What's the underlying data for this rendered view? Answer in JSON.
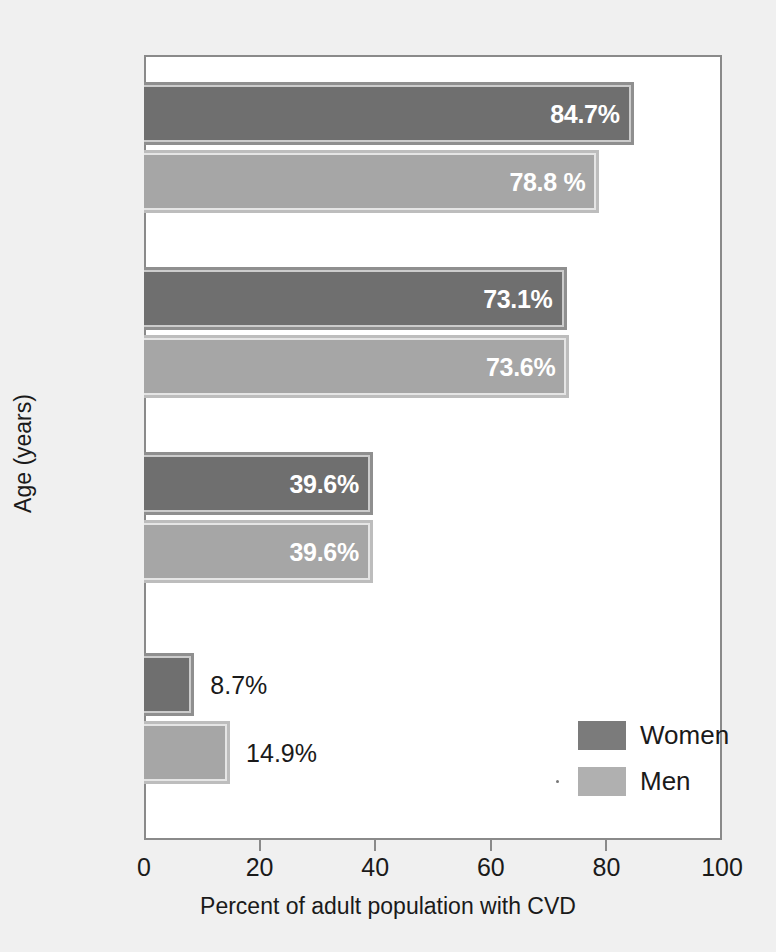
{
  "chart_data": {
    "type": "bar",
    "orientation": "horizontal",
    "title": "",
    "xlabel": "Percent of adult population with CVD",
    "ylabel": "Age (years)",
    "xlim": [
      0,
      100
    ],
    "xticks": [
      "0",
      "20",
      "40",
      "60",
      "80",
      "100"
    ],
    "grid": false,
    "legend_position": "bottom-right",
    "categories": [
      "80+",
      "60–79",
      "40–59",
      "20–30"
    ],
    "series": [
      {
        "name": "Women",
        "color": "#6f6f6f",
        "values": [
          84.7,
          73.1,
          39.6,
          8.7
        ],
        "labels": [
          "84.7%",
          "73.1%",
          "39.6%",
          "8.7%"
        ],
        "label_placement": [
          "inside",
          "inside",
          "inside",
          "outside"
        ]
      },
      {
        "name": "Men",
        "color": "#a6a6a6",
        "values": [
          78.8,
          73.6,
          39.6,
          14.9
        ],
        "labels": [
          "78.8 %",
          "73.6%",
          "39.6%",
          "14.9%"
        ],
        "label_placement": [
          "inside",
          "inside",
          "inside",
          "outside"
        ]
      }
    ]
  },
  "axes": {
    "x_title": "Percent of adult population with CVD",
    "y_title": "Age (years)",
    "x_ticks": [
      {
        "label": "0",
        "value": 0
      },
      {
        "label": "20",
        "value": 20
      },
      {
        "label": "40",
        "value": 40
      },
      {
        "label": "60",
        "value": 60
      },
      {
        "label": "80",
        "value": 80
      },
      {
        "label": "100",
        "value": 100
      }
    ],
    "y_ticks": [
      {
        "label": "80+"
      },
      {
        "label": "60–79"
      },
      {
        "label": "40–59"
      },
      {
        "label": "20–30"
      }
    ]
  },
  "legend": {
    "items": [
      {
        "label": "Women",
        "color": "#7b7b7b"
      },
      {
        "label": "Men",
        "color": "#b0b0b0"
      }
    ]
  },
  "bars": [
    {
      "group": "80+",
      "series": "Women",
      "value": 84.7,
      "label": "84.7%",
      "placement": "inside"
    },
    {
      "group": "80+",
      "series": "Men",
      "value": 78.8,
      "label": "78.8 %",
      "placement": "inside"
    },
    {
      "group": "60–79",
      "series": "Women",
      "value": 73.1,
      "label": "73.1%",
      "placement": "inside"
    },
    {
      "group": "60–79",
      "series": "Men",
      "value": 73.6,
      "label": "73.6%",
      "placement": "inside"
    },
    {
      "group": "40–59",
      "series": "Women",
      "value": 39.6,
      "label": "39.6%",
      "placement": "inside"
    },
    {
      "group": "40–59",
      "series": "Men",
      "value": 39.6,
      "label": "39.6%",
      "placement": "inside"
    },
    {
      "group": "20–30",
      "series": "Women",
      "value": 8.7,
      "label": "8.7%",
      "placement": "outside"
    },
    {
      "group": "20–30",
      "series": "Men",
      "value": 14.9,
      "label": "14.9%",
      "placement": "outside"
    }
  ],
  "colors": {
    "women": "#6f6f6f",
    "men": "#a6a6a6",
    "axis": "#8a8a8a",
    "background": "#f0f0f0",
    "plot_background": "#ffffff",
    "text": "#1a1a1a",
    "inside_label": "#ffffff"
  }
}
